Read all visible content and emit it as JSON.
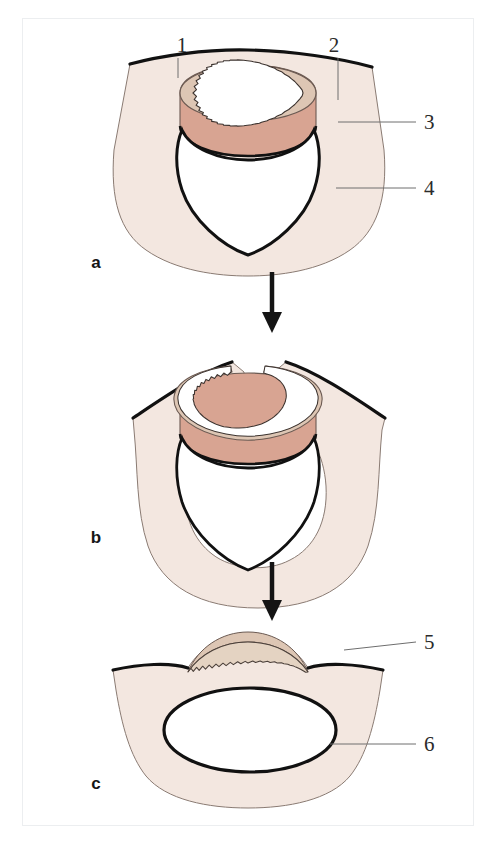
{
  "figure": {
    "kind": "anatomical-diagram",
    "panel_count": 3,
    "colors": {
      "body_fill": "#f3e7e0",
      "band_fill": "#d8a492",
      "ring_fill": "#ddc6b4",
      "cavity_fill": "#ffffff",
      "outline": "#111111",
      "thin_outline": "#6b5a52",
      "leader_line": "#6e6e6e",
      "label_text": "#2b2b2b",
      "frame_border": "#eceef0",
      "page_background": "#ffffff",
      "arrow": "#141414"
    }
  },
  "panels": [
    {
      "id": "a",
      "letter": "a",
      "letter_x": 96,
      "letter_y": 268,
      "description": "Intact funnel-shaped structure with a serrated ring seated on a collar above a heart-shaped cavity"
    },
    {
      "id": "b",
      "letter": "b",
      "letter_x": 96,
      "letter_y": 543,
      "description": "Serrated ring split open at the top, walls everted outward"
    },
    {
      "id": "c",
      "letter": "c",
      "letter_x": 96,
      "letter_y": 789,
      "description": "Flattened result: serrated crest over a dome with a wide oval opening below"
    }
  ],
  "callouts": [
    {
      "number": "1",
      "panel": "a",
      "text_x": 182,
      "text_y": 52,
      "leader": "M 178 58 L 178 78",
      "target": "upper outer wall edge"
    },
    {
      "number": "2",
      "panel": "a",
      "text_x": 334,
      "text_y": 52,
      "leader": "M 338 58 L 338 100",
      "target": "serrated inner ring"
    },
    {
      "number": "3",
      "panel": "a",
      "text_x": 420,
      "text_y": 128,
      "leader": "M 416 122 L 338 122",
      "target": "collar band"
    },
    {
      "number": "4",
      "panel": "a",
      "text_x": 420,
      "text_y": 194,
      "leader": "M 416 188 L 336 188",
      "target": "cavity margin"
    },
    {
      "number": "5",
      "panel": "c",
      "text_x": 420,
      "text_y": 648,
      "leader": "M 416 642 L 344 642",
      "target": "serrated crest"
    },
    {
      "number": "6",
      "panel": "c",
      "text_x": 420,
      "text_y": 750,
      "leader": "M 416 744 L 348 744",
      "target": "oval opening"
    }
  ],
  "arrows": [
    {
      "id": "arrow-a-to-b",
      "from_panel": "a",
      "to_panel": "b",
      "x": 272,
      "y_top": 272,
      "y_bottom": 330
    },
    {
      "id": "arrow-b-to-c",
      "from_panel": "b",
      "to_panel": "c",
      "x": 272,
      "y_top": 562,
      "y_bottom": 618
    }
  ]
}
